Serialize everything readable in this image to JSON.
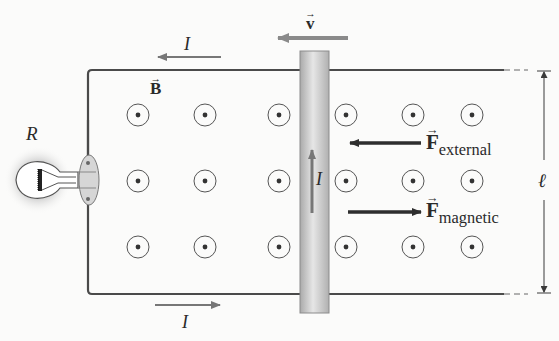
{
  "diagram": {
    "labels": {
      "resistance": "R",
      "current_top": "I",
      "current_bottom": "I",
      "current_rod": "I",
      "field": "B",
      "velocity": "v",
      "force_external_symbol": "F",
      "force_external_sub": "external",
      "force_magnetic_symbol": "F",
      "force_magnetic_sub": "magnetic",
      "length": "ℓ"
    },
    "field_direction": "out-of-page (dot symbols)",
    "field_grid": {
      "rows": 3,
      "columns": 7
    },
    "colors": {
      "wire": "#4a4a4a",
      "rod": "#c8c8c8",
      "velocity_arrow": "#8a8a8a",
      "force_arrows": "#2e2e2e",
      "background": "#fbfbfa"
    }
  }
}
